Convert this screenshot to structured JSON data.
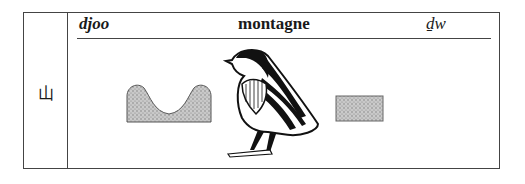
{
  "entry": {
    "chinese_character": "山",
    "pronunciation": "djoo",
    "gloss": "montagne",
    "transliteration": "ḏw"
  },
  "glyphs": [
    {
      "name": "mountain-sign",
      "description": "stippled U-shaped hill sign"
    },
    {
      "name": "quail-chick-sign",
      "description": "quail chick hieroglyph"
    },
    {
      "name": "rectangle-sign",
      "description": "stippled rectangle sign"
    }
  ],
  "colors": {
    "border": "#444444",
    "stipple": "#9a9a9a",
    "ink": "#111111"
  }
}
